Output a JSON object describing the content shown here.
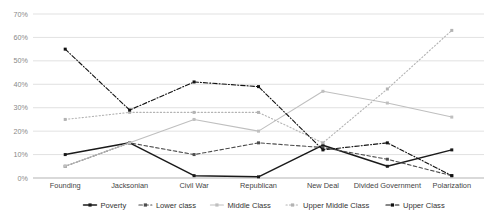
{
  "chart_data": {
    "type": "line",
    "title": "",
    "xlabel": "",
    "ylabel": "",
    "ylim": [
      0,
      70
    ],
    "ytick_labels": [
      "0%",
      "10%",
      "20%",
      "30%",
      "40%",
      "50%",
      "60%",
      "70%"
    ],
    "ytick_values": [
      0,
      10,
      20,
      30,
      40,
      50,
      60,
      70
    ],
    "grid": true,
    "legend_position": "bottom",
    "categories": [
      "Founding",
      "Jacksonian",
      "Civil War",
      "Republican",
      "New Deal",
      "Divided Government",
      "Polarization"
    ],
    "series": [
      {
        "name": "Poverty",
        "color": "#1a1a1a",
        "style": "solid",
        "marker": "square",
        "values": [
          10,
          15,
          1,
          0.5,
          14,
          5,
          12
        ]
      },
      {
        "name": "Lower class",
        "color": "#4d4d4d",
        "style": "dashed",
        "marker": "square",
        "values": [
          5,
          15,
          10,
          15,
          13,
          8,
          1
        ]
      },
      {
        "name": "Middle Class",
        "color": "#bfbfbf",
        "style": "solid",
        "marker": "square",
        "values": [
          5,
          15,
          25,
          20,
          37,
          32,
          26
        ]
      },
      {
        "name": "Upper Middle Class",
        "color": "#b3b3b3",
        "style": "dotted",
        "marker": "square",
        "values": [
          25,
          28,
          28,
          28,
          15,
          38,
          63
        ]
      },
      {
        "name": "Upper Class",
        "color": "#111111",
        "style": "dashdot",
        "marker": "square",
        "values": [
          55,
          29,
          41,
          39,
          12,
          15,
          1
        ]
      }
    ]
  },
  "legend": {
    "items": [
      {
        "label": "Poverty"
      },
      {
        "label": "Lower class"
      },
      {
        "label": "Middle Class"
      },
      {
        "label": "Upper Middle Class"
      },
      {
        "label": "Upper Class"
      }
    ]
  }
}
